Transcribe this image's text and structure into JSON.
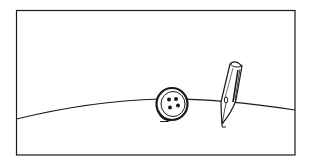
{
  "illustration": {
    "style": "pen-and-ink line drawing",
    "ink_color": "#1a1a1a",
    "background_color": "#ffffff",
    "frame": {
      "x": 16,
      "y": 10,
      "width": 279,
      "height": 145
    },
    "elements": [
      {
        "name": "horizon-curve",
        "description": "curved ground line"
      },
      {
        "name": "button",
        "description": "four-hole sewing button standing upright",
        "holes": 4
      },
      {
        "name": "pen-nib",
        "description": "dip pen nib standing on its tip"
      }
    ]
  }
}
